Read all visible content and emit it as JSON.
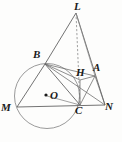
{
  "figure": {
    "canvas": {
      "width": 122,
      "height": 142
    },
    "colors": {
      "background": "#fdfdfc",
      "stroke": "#5a5a5a",
      "circle_stroke": "#8a8a8a",
      "label": "#1a1a1a",
      "center_dot": "#1a1a1a"
    },
    "circle": {
      "name": "circumcircle",
      "cx": 47,
      "cy": 96,
      "r": 32.5
    },
    "center_point": {
      "label": "O",
      "x": 47,
      "y": 96,
      "label_x": 50,
      "label_y": 91
    },
    "points": [
      {
        "id": "L",
        "label": "L",
        "x": 76,
        "y": 13,
        "label_x": 75,
        "label_y": 1
      },
      {
        "id": "B",
        "label": "B",
        "x": 45,
        "y": 64,
        "label_x": 33,
        "label_y": 50
      },
      {
        "id": "H",
        "label": "H",
        "x": 80,
        "y": 80,
        "label_x": 76,
        "label_y": 68
      },
      {
        "id": "A",
        "label": "A",
        "x": 95,
        "y": 76,
        "label_x": 94,
        "label_y": 63
      },
      {
        "id": "M",
        "label": "M",
        "x": 17,
        "y": 107,
        "label_x": 2,
        "label_y": 103
      },
      {
        "id": "C",
        "label": "C",
        "x": 80,
        "y": 105,
        "label_x": 76,
        "label_y": 106
      },
      {
        "id": "N",
        "label": "N",
        "x": 105,
        "y": 105,
        "label_x": 106,
        "label_y": 102
      }
    ],
    "segments": [
      {
        "id": "LB",
        "from": "L",
        "to": "B",
        "style": "solid"
      },
      {
        "id": "LC",
        "from": "L",
        "to": "C",
        "style": "dashed"
      },
      {
        "id": "LN",
        "from": "L",
        "to": "N",
        "style": "solid"
      },
      {
        "id": "LA",
        "from": "L",
        "to": "A",
        "style": "solid"
      },
      {
        "id": "BM",
        "from": "B",
        "to": "M",
        "style": "solid"
      },
      {
        "id": "BC",
        "from": "B",
        "to": "C",
        "style": "solid"
      },
      {
        "id": "BH",
        "from": "B",
        "to": "H",
        "style": "solid"
      },
      {
        "id": "BA",
        "from": "B",
        "to": "A",
        "style": "solid"
      },
      {
        "id": "BN",
        "from": "B",
        "to": "N",
        "style": "solid"
      },
      {
        "id": "MN",
        "from": "M",
        "to": "N",
        "style": "solid"
      },
      {
        "id": "HC",
        "from": "H",
        "to": "C",
        "style": "solid"
      },
      {
        "id": "HA",
        "from": "H",
        "to": "A",
        "style": "solid"
      },
      {
        "id": "AC",
        "from": "A",
        "to": "C",
        "style": "solid"
      },
      {
        "id": "AN",
        "from": "A",
        "to": "N",
        "style": "solid"
      },
      {
        "id": "OC",
        "from": "O",
        "to": "C",
        "style": "solid"
      }
    ],
    "labels": {
      "L": "L",
      "B": "B",
      "H": "H",
      "A": "A",
      "M": "M",
      "C": "C",
      "N": "N",
      "O": "O"
    }
  }
}
